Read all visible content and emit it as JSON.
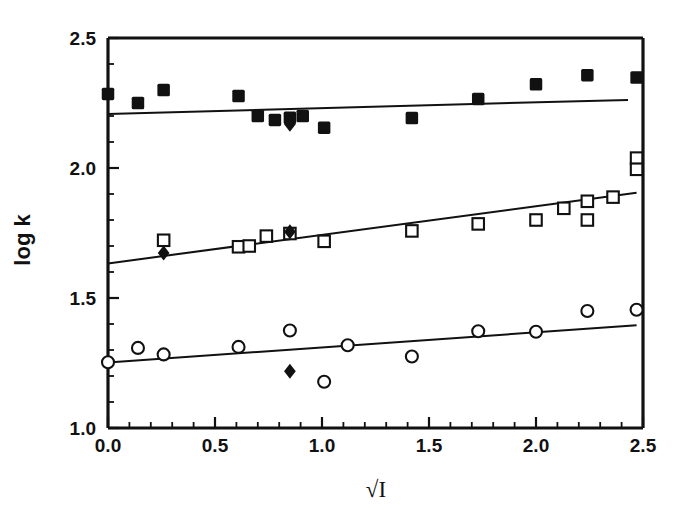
{
  "chart_data": {
    "type": "scatter",
    "title": "",
    "subtitle": "",
    "xlabel": "√I",
    "ylabel": "log k",
    "xlim": [
      0.0,
      2.5
    ],
    "ylim": [
      1.0,
      2.5
    ],
    "x_ticks": [
      "0.0",
      "0.5",
      "1.0",
      "1.5",
      "2.0",
      "2.5"
    ],
    "x_tick_values": [
      0.0,
      0.5,
      1.0,
      1.5,
      2.0,
      2.5
    ],
    "x_minor_step": 0.1,
    "y_ticks": [
      "1.0",
      "1.5",
      "2.0",
      "2.5"
    ],
    "y_tick_values": [
      1.0,
      1.5,
      2.0,
      2.5
    ],
    "y_minor_step": 0.1,
    "grid": false,
    "legend": "none",
    "axis_color": "#111111",
    "marker_color": "#111111",
    "line_color": "#111111",
    "background": "#ffffff",
    "series": [
      {
        "name": "upper-series-filled-squares",
        "marker": "filled-square",
        "points": [
          {
            "x": 0.0,
            "y": 2.285
          },
          {
            "x": 0.14,
            "y": 2.25
          },
          {
            "x": 0.26,
            "y": 2.3
          },
          {
            "x": 0.61,
            "y": 2.277
          },
          {
            "x": 0.7,
            "y": 2.2
          },
          {
            "x": 0.78,
            "y": 2.185
          },
          {
            "x": 0.85,
            "y": 2.193
          },
          {
            "x": 0.91,
            "y": 2.2
          },
          {
            "x": 1.01,
            "y": 2.155
          },
          {
            "x": 1.42,
            "y": 2.192
          },
          {
            "x": 1.73,
            "y": 2.265
          },
          {
            "x": 2.0,
            "y": 2.322
          },
          {
            "x": 2.24,
            "y": 2.357
          },
          {
            "x": 2.47,
            "y": 2.348
          }
        ]
      },
      {
        "name": "upper-series-filled-diamonds",
        "marker": "filled-diamond",
        "points": [
          {
            "x": 0.85,
            "y": 2.168
          }
        ]
      },
      {
        "name": "middle-series-open-squares",
        "marker": "open-square",
        "points": [
          {
            "x": 0.26,
            "y": 1.722
          },
          {
            "x": 0.61,
            "y": 1.697
          },
          {
            "x": 0.66,
            "y": 1.7
          },
          {
            "x": 0.74,
            "y": 1.738
          },
          {
            "x": 0.85,
            "y": 1.748
          },
          {
            "x": 1.01,
            "y": 1.718
          },
          {
            "x": 1.42,
            "y": 1.758
          },
          {
            "x": 1.73,
            "y": 1.785
          },
          {
            "x": 2.0,
            "y": 1.8
          },
          {
            "x": 2.13,
            "y": 1.845
          },
          {
            "x": 2.24,
            "y": 1.8
          },
          {
            "x": 2.24,
            "y": 1.872
          },
          {
            "x": 2.36,
            "y": 1.888
          },
          {
            "x": 2.47,
            "y": 2.038
          },
          {
            "x": 2.47,
            "y": 1.995
          }
        ]
      },
      {
        "name": "middle-series-filled-diamonds",
        "marker": "filled-diamond",
        "points": [
          {
            "x": 0.26,
            "y": 1.673
          },
          {
            "x": 0.85,
            "y": 1.755
          }
        ]
      },
      {
        "name": "lower-series-open-circles",
        "marker": "open-circle",
        "points": [
          {
            "x": 0.0,
            "y": 1.253
          },
          {
            "x": 0.14,
            "y": 1.308
          },
          {
            "x": 0.26,
            "y": 1.283
          },
          {
            "x": 0.61,
            "y": 1.312
          },
          {
            "x": 0.85,
            "y": 1.375
          },
          {
            "x": 1.01,
            "y": 1.178
          },
          {
            "x": 1.12,
            "y": 1.318
          },
          {
            "x": 1.42,
            "y": 1.275
          },
          {
            "x": 1.73,
            "y": 1.372
          },
          {
            "x": 2.0,
            "y": 1.37
          },
          {
            "x": 2.24,
            "y": 1.45
          },
          {
            "x": 2.47,
            "y": 1.455
          }
        ]
      },
      {
        "name": "lower-series-filled-diamonds",
        "marker": "filled-diamond",
        "points": [
          {
            "x": 0.85,
            "y": 1.218
          }
        ]
      }
    ],
    "fit_lines": [
      {
        "name": "upper-fit-line",
        "x0": 0.0,
        "y0": 2.208,
        "x1": 2.43,
        "y1": 2.262
      },
      {
        "name": "middle-fit-line",
        "x0": 0.0,
        "y0": 1.633,
        "x1": 2.47,
        "y1": 1.905
      },
      {
        "name": "lower-fit-line",
        "x0": 0.0,
        "y0": 1.252,
        "x1": 2.47,
        "y1": 1.395
      }
    ]
  }
}
